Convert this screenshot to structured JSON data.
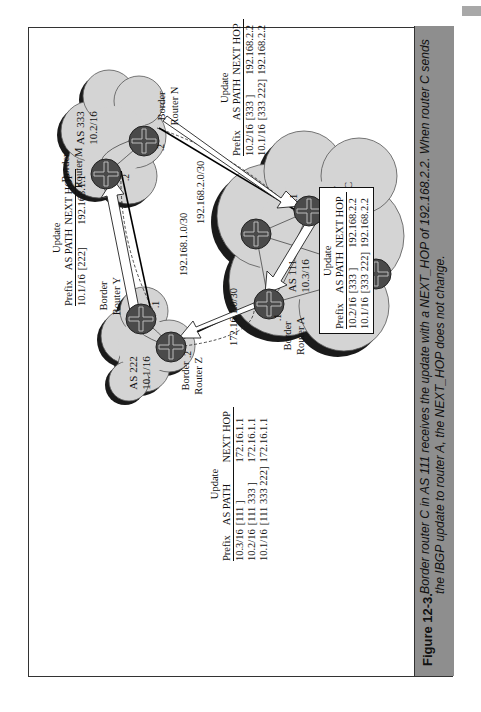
{
  "figure": {
    "number": "Figure 12-3.",
    "caption": "Border router C in AS 111 receives the update with a NEXT_HOP of 192.168.2.2. When router C sends the IBGP update to router A, the NEXT_HOP does not change."
  },
  "autonomous_systems": [
    {
      "name": "AS 333",
      "prefix": "10.2/16"
    },
    {
      "name": "AS 222",
      "prefix": "10.1/16"
    },
    {
      "name": "AS 111",
      "prefix": "10.3/16"
    }
  ],
  "routers": [
    {
      "id": "M",
      "label_line1": "Border",
      "label_line2": "Router M",
      "iface": ".2"
    },
    {
      "id": "N",
      "label_line1": "Border",
      "label_line2": "Router N",
      "iface": ".2"
    },
    {
      "id": "Y",
      "label_line1": "Border",
      "label_line2": "Router Y",
      "iface": ".1"
    },
    {
      "id": "Z",
      "label_line1": "Border",
      "label_line2": "Router Z",
      "iface": ".2"
    },
    {
      "id": "A",
      "label_line1": "Border",
      "label_line2": "Router A",
      "iface": ".1"
    },
    {
      "id": "C",
      "label_line1": "Border",
      "label_line2": "Router C",
      "iface": ".1"
    }
  ],
  "links": [
    {
      "subnet": "192.168.2.0/30"
    },
    {
      "subnet": "192.168.1.0/30"
    },
    {
      "subnet": "172.16.1.0/30"
    }
  ],
  "update_tables": [
    {
      "id": "n-to-c",
      "title": "Update",
      "headers": [
        "Prefix",
        "AS PATH",
        "NEXT HOP"
      ],
      "rows": [
        [
          "10.2/16",
          "[333      ]",
          "192.168.2.2"
        ],
        [
          "10.1/16",
          "[333 222]",
          "192.168.2.2"
        ]
      ]
    },
    {
      "id": "y-to-m",
      "title": "Update",
      "headers": [
        "Prefix",
        "AS PATH",
        "NEXT HOP"
      ],
      "rows": [
        [
          "10.1/16",
          "[222]",
          "192.168.1.1"
        ]
      ]
    },
    {
      "id": "a-to-z",
      "title": "Update",
      "headers": [
        "Prefix",
        "AS PATH",
        "NEXT HOP"
      ],
      "rows": [
        [
          "10.3/16",
          "[111            ]",
          "172.16.1.1"
        ],
        [
          "10.2/16",
          "[111 333     ]",
          "172.16.1.1"
        ],
        [
          "10.1/16",
          "[111 333 222]",
          "172.16.1.1"
        ]
      ]
    },
    {
      "id": "c-to-a-ibgp",
      "title": "Update",
      "headers": [
        "Prefix",
        "AS PATH",
        "NEXT HOP"
      ],
      "rows": [
        [
          "10.2/16",
          "[333      ]",
          "192.168.2.2"
        ],
        [
          "10.1/16",
          "[333 222]",
          "192.168.2.2"
        ]
      ]
    }
  ],
  "colors": {
    "cloud_fill": "#d4d4d4",
    "cloud_shadow": "#1a1a1a",
    "router_fill": "#4a4a4a",
    "caption_band": "#8e8e8e"
  }
}
